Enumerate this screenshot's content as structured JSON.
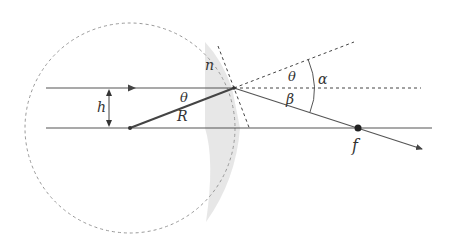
{
  "diagram": {
    "labels": {
      "n": "n",
      "h": "h",
      "theta_inner": "θ",
      "R": "R",
      "theta_outer": "θ",
      "alpha": "α",
      "beta": "β",
      "f": "f"
    },
    "colors": {
      "line": "#555555",
      "dash": "#444444",
      "circle": "#999999",
      "shade": "#e6e6e6",
      "point": "#222222"
    }
  }
}
